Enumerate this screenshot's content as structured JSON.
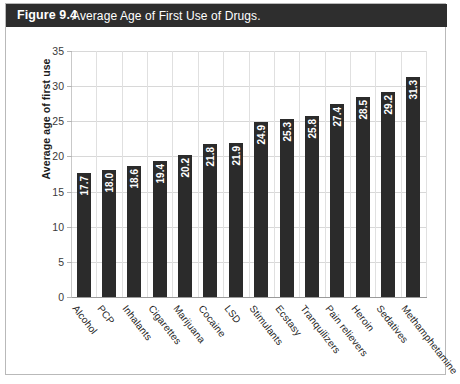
{
  "figure": {
    "number_label": "Figure 9.4",
    "caption": "Average Age of First Use of Drugs.",
    "banner_color": "#2e2e2e",
    "bar_color": "#2b2b2b",
    "grid_color": "#d8d8d8",
    "border_color": "#b9b9b9"
  },
  "chart_data": {
    "type": "bar",
    "title": "Average Age of First Use of Drugs.",
    "xlabel": "",
    "ylabel": "Average age of first use",
    "ylim": [
      0,
      35
    ],
    "yticks": [
      0,
      5,
      10,
      15,
      20,
      25,
      30,
      35
    ],
    "grid": "both",
    "legend": "none",
    "orientation": "vertical",
    "value_labels": "inside-top-rotated",
    "categories": [
      "Alcohol",
      "PCP",
      "Inhalants",
      "Cigarettes",
      "Marijuana",
      "Cocaine",
      "LSD",
      "Stimulants",
      "Ecstasy",
      "Tranquilizers",
      "Pain relievers",
      "Heroin",
      "Sedatives",
      "Methamphetamine"
    ],
    "values": [
      17.7,
      18.0,
      18.6,
      19.4,
      20.2,
      21.8,
      21.9,
      24.9,
      25.3,
      25.8,
      27.4,
      28.5,
      29.2,
      31.3
    ],
    "value_text": [
      "17.7",
      "18.0",
      "18.6",
      "19.4",
      "20.2",
      "21.8",
      "21.9",
      "24.9",
      "25.3",
      "25.8",
      "27.4",
      "28.5",
      "29.2",
      "31.3"
    ],
    "ytick_text": [
      "0",
      "5",
      "10",
      "15",
      "20",
      "25",
      "30",
      "35"
    ]
  }
}
